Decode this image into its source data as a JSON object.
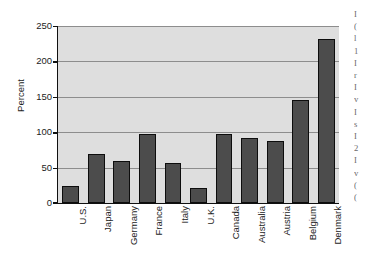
{
  "chart_data": {
    "type": "bar",
    "title": "",
    "subtitle": "",
    "xlabel": "",
    "ylabel": "Percent",
    "ylim": [
      0,
      250
    ],
    "ytick_step": 50,
    "yticks": [
      "0",
      "50",
      "100",
      "150",
      "200",
      "250"
    ],
    "grid": "horizontal",
    "legend": "none",
    "orientation": "vertical",
    "xlabel_rotation_degrees": 90,
    "categories": [
      "U.S.",
      "Japan",
      "Germany",
      "France",
      "Italy",
      "U.K.",
      "Canada",
      "Australia",
      "Austria",
      "Belgium",
      "Denmark"
    ],
    "values": [
      24,
      69,
      60,
      98,
      57,
      21,
      97,
      92,
      87,
      145,
      232
    ],
    "series": [
      {
        "name": "Percent",
        "values": [
          24,
          69,
          60,
          98,
          57,
          21,
          97,
          92,
          87,
          145,
          232
        ]
      }
    ],
    "colors": {
      "bar_fill": "#4c4c4c",
      "bar_edge": "#0d0d0d",
      "plot_background": "#dedede",
      "gridline": "#8d8d8d",
      "axis": "#101010",
      "text": "#1c1c1c",
      "page_background": "#ffffff"
    }
  },
  "edge_column_text": {
    "lines": [
      "I",
      "(",
      "l",
      "1",
      "I",
      "r",
      "I",
      "v",
      "I",
      "s",
      "I",
      "2",
      "I",
      "v",
      "(",
      "("
    ]
  }
}
